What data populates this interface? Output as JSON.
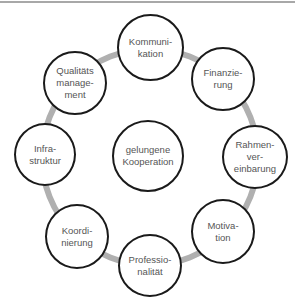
{
  "diagram": {
    "center": {
      "label": "gelungene\nKooperation"
    },
    "nodes": [
      {
        "label": "Kommuni-\nkation"
      },
      {
        "label": "Finanzie-\nrung"
      },
      {
        "label": "Rahmen-\nver-\neinbarung"
      },
      {
        "label": "Motiva-\ntion"
      },
      {
        "label": "Professio-\nnalität"
      },
      {
        "label": "Koordi-\nnierung"
      },
      {
        "label": "Infra-\nstruktur"
      },
      {
        "label": "Qualitäts\nmanage-\nment"
      }
    ],
    "colors": {
      "ring": "#b0b0b0",
      "outline": "#1a1a1a",
      "text": "#555555"
    }
  }
}
